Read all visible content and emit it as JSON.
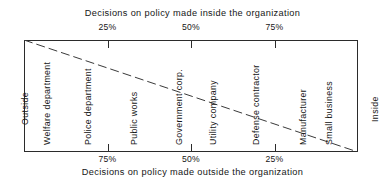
{
  "chart_data": {
    "type": "line",
    "title": "",
    "top_axis_label": "Decisions on policy made inside the organization",
    "bottom_axis_label": "Decisions on policy made outside the organization",
    "left_axis_label": "Outside",
    "right_axis_label": "Inside",
    "grid": false,
    "legend": "none",
    "x": [
      0,
      25,
      50,
      75,
      100
    ],
    "xlim": [
      0,
      100
    ],
    "ylim": [
      0,
      100
    ],
    "top_ticks": [
      {
        "label": "25%",
        "position": 25
      },
      {
        "label": "50%",
        "position": 50
      },
      {
        "label": "75%",
        "position": 75
      }
    ],
    "bottom_ticks": [
      {
        "label": "75%",
        "position": 25
      },
      {
        "label": "50%",
        "position": 50
      },
      {
        "label": "25%",
        "position": 75
      }
    ],
    "categories": [
      {
        "label": "Welfare department",
        "position": 3
      },
      {
        "label": "Police department",
        "position": 15.3
      },
      {
        "label": "Public works",
        "position": 29.0
      },
      {
        "label": "Government corp.",
        "position": 42.5
      },
      {
        "label": "Utility company",
        "position": 52.7
      },
      {
        "label": "Defense contractor",
        "position": 65.6
      },
      {
        "label": "Manufacturer",
        "position": 79.6
      },
      {
        "label": "Small business",
        "position": 87.4
      }
    ],
    "series": [
      {
        "name": "inside-outside continuum",
        "style": "dashed",
        "x": [
          0,
          100
        ],
        "values": [
          100,
          0
        ]
      }
    ]
  }
}
